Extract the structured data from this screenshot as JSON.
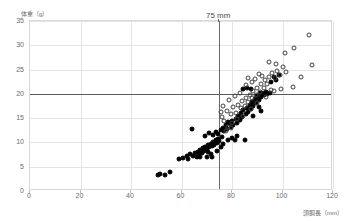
{
  "chart_data": {
    "type": "scatter",
    "title": "",
    "xlabel": "頭胴長（mm）",
    "ylabel": "体重（g）",
    "xlim": [
      0,
      120
    ],
    "ylim": [
      0,
      35
    ],
    "xticks": [
      0,
      20,
      40,
      60,
      80,
      100,
      120
    ],
    "yticks": [
      0,
      5,
      10,
      15,
      20,
      25,
      30,
      35
    ],
    "grid": true,
    "legend": "none",
    "annotations": [
      {
        "text": "75 mm",
        "x": 75,
        "y": 35,
        "anchor": "top"
      }
    ],
    "reference_lines": [
      {
        "orientation": "vertical",
        "value": 75,
        "color": "#6a6a6a",
        "label": "75 mm"
      },
      {
        "orientation": "horizontal",
        "value": 20,
        "color": "#5a5a5a",
        "label": ""
      }
    ],
    "series": [
      {
        "name": "filled",
        "marker": "filled-circle",
        "color": "#000000",
        "points": [
          [
            50.5,
            3.2
          ],
          [
            51.5,
            3.6
          ],
          [
            53.5,
            3.3
          ],
          [
            55.5,
            4.0
          ],
          [
            59.0,
            6.6
          ],
          [
            62.0,
            7.3
          ],
          [
            63.5,
            7.6
          ],
          [
            64.5,
            7.2
          ],
          [
            65.5,
            7.9
          ],
          [
            66.5,
            8.1
          ],
          [
            67.0,
            7.4
          ],
          [
            67.5,
            8.5
          ],
          [
            68.0,
            7.8
          ],
          [
            68.5,
            8.8
          ],
          [
            69.0,
            8.2
          ],
          [
            69.5,
            9.1
          ],
          [
            70.0,
            8.6
          ],
          [
            70.5,
            9.4
          ],
          [
            70.5,
            8.0
          ],
          [
            71.0,
            9.0
          ],
          [
            71.5,
            9.7
          ],
          [
            72.0,
            9.2
          ],
          [
            72.5,
            10.0
          ],
          [
            73.0,
            9.5
          ],
          [
            73.5,
            10.4
          ],
          [
            74.0,
            9.8
          ],
          [
            74.5,
            10.8
          ],
          [
            75.0,
            10.2
          ],
          [
            64.0,
            12.8
          ],
          [
            69.5,
            11.3
          ],
          [
            71.0,
            11.9
          ],
          [
            72.5,
            11.5
          ],
          [
            73.5,
            12.2
          ],
          [
            74.5,
            11.7
          ],
          [
            75.5,
            12.6
          ],
          [
            76.0,
            11.2
          ],
          [
            76.5,
            13.0
          ],
          [
            77.0,
            12.3
          ],
          [
            77.5,
            13.5
          ],
          [
            78.0,
            12.8
          ],
          [
            78.5,
            10.6
          ],
          [
            79.0,
            13.9
          ],
          [
            79.5,
            13.2
          ],
          [
            80.0,
            14.4
          ],
          [
            80.5,
            13.6
          ],
          [
            81.0,
            10.5
          ],
          [
            81.5,
            14.9
          ],
          [
            82.0,
            14.1
          ],
          [
            82.5,
            15.4
          ],
          [
            83.0,
            14.6
          ],
          [
            83.5,
            16.0
          ],
          [
            84.0,
            15.2
          ],
          [
            84.5,
            16.6
          ],
          [
            85.0,
            10.6
          ],
          [
            85.5,
            15.8
          ],
          [
            86.0,
            17.1
          ],
          [
            86.5,
            16.3
          ],
          [
            87.0,
            17.7
          ],
          [
            87.5,
            16.9
          ],
          [
            88.0,
            18.3
          ],
          [
            88.5,
            17.5
          ],
          [
            89.0,
            19.0
          ],
          [
            89.5,
            18.1
          ],
          [
            90.0,
            19.6
          ],
          [
            90.5,
            18.7
          ],
          [
            91.0,
            20.2
          ],
          [
            91.5,
            19.3
          ],
          [
            92.0,
            20.1
          ],
          [
            92.5,
            19.8
          ],
          [
            93.0,
            20.0
          ],
          [
            93.5,
            20.3
          ],
          [
            94.0,
            19.9
          ],
          [
            95.0,
            20.1
          ],
          [
            84.5,
            21.0
          ],
          [
            86.0,
            21.3
          ],
          [
            87.5,
            21.1
          ],
          [
            95.5,
            22.5
          ],
          [
            96.5,
            23.4
          ],
          [
            97.5,
            22.9
          ],
          [
            98.5,
            23.8
          ],
          [
            66.0,
            6.9
          ],
          [
            60.5,
            6.8
          ],
          [
            62.5,
            6.5
          ],
          [
            75.5,
            9.0
          ],
          [
            76.5,
            9.6
          ],
          [
            71.5,
            7.6
          ],
          [
            72.0,
            7.0
          ],
          [
            74.0,
            8.2
          ],
          [
            67.5,
            6.9
          ],
          [
            70.0,
            7.1
          ],
          [
            78.5,
            14.2
          ],
          [
            80.0,
            11.0
          ],
          [
            82.0,
            11.4
          ],
          [
            90.5,
            17.2
          ],
          [
            91.5,
            16.5
          ],
          [
            88.5,
            15.4
          ]
        ]
      },
      {
        "name": "open",
        "marker": "open-circle",
        "color": "#3f3f3f",
        "points": [
          [
            78.0,
            16.5
          ],
          [
            79.5,
            15.8
          ],
          [
            80.5,
            17.2
          ],
          [
            81.5,
            16.1
          ],
          [
            82.5,
            17.8
          ],
          [
            83.5,
            17.0
          ],
          [
            84.0,
            18.5
          ],
          [
            85.0,
            17.6
          ],
          [
            85.5,
            19.2
          ],
          [
            86.5,
            18.4
          ],
          [
            87.0,
            19.8
          ],
          [
            88.0,
            19.1
          ],
          [
            88.5,
            20.5
          ],
          [
            89.5,
            19.7
          ],
          [
            90.0,
            21.2
          ],
          [
            91.0,
            20.4
          ],
          [
            91.5,
            22.0
          ],
          [
            92.5,
            21.3
          ],
          [
            93.0,
            22.8
          ],
          [
            94.0,
            22.1
          ],
          [
            94.5,
            23.5
          ],
          [
            95.5,
            20.8
          ],
          [
            96.0,
            24.2
          ],
          [
            97.0,
            23.2
          ],
          [
            98.0,
            24.8
          ],
          [
            99.0,
            23.9
          ],
          [
            100.0,
            25.5
          ],
          [
            101.5,
            24.6
          ],
          [
            90.5,
            24.0
          ],
          [
            92.0,
            23.7
          ],
          [
            86.5,
            23.2
          ],
          [
            89.0,
            23.0
          ],
          [
            94.5,
            26.5
          ],
          [
            97.5,
            26.2
          ],
          [
            101.0,
            28.5
          ],
          [
            104.5,
            29.4
          ],
          [
            110.5,
            32.2
          ],
          [
            111.5,
            26.0
          ],
          [
            107.5,
            23.5
          ],
          [
            104.0,
            21.5
          ],
          [
            99.5,
            21.0
          ],
          [
            96.5,
            20.6
          ],
          [
            93.5,
            19.4
          ],
          [
            90.0,
            18.2
          ],
          [
            87.5,
            16.9
          ],
          [
            84.5,
            15.5
          ],
          [
            82.0,
            14.8
          ],
          [
            80.0,
            13.9
          ],
          [
            78.5,
            13.1
          ],
          [
            77.0,
            14.5
          ],
          [
            76.0,
            15.3
          ],
          [
            79.0,
            18.8
          ],
          [
            81.0,
            19.5
          ],
          [
            83.0,
            20.1
          ],
          [
            85.5,
            21.8
          ],
          [
            88.0,
            22.4
          ],
          [
            76.5,
            17.4
          ],
          [
            77.5,
            12.4
          ],
          [
            79.5,
            12.9
          ],
          [
            75.5,
            16.2
          ]
        ]
      }
    ]
  }
}
